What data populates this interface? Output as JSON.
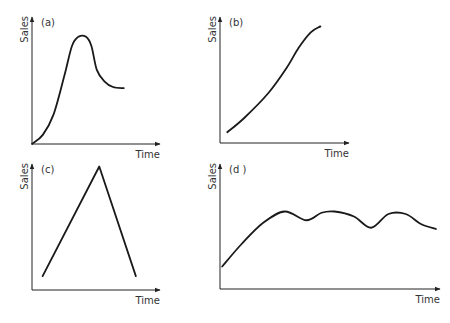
{
  "chart_data": [
    {
      "type": "line",
      "panel": "(a)",
      "title": "(a)",
      "xlabel": "Time",
      "ylabel": "Sales",
      "xlim": [
        0,
        10
      ],
      "ylim": [
        0,
        10
      ],
      "grid": false,
      "description": "S-shaped rise to a peak, then decline and levelling off",
      "x": [
        0,
        1,
        2,
        3,
        3.7,
        4.3,
        5,
        5.5,
        6,
        6.7,
        7.5,
        8.5
      ],
      "y": [
        0,
        0.8,
        2.6,
        6.0,
        8.6,
        9.4,
        9.4,
        8.6,
        6.5,
        5.5,
        5.0,
        4.9
      ]
    },
    {
      "type": "line",
      "panel": "(b)",
      "title": "(b)",
      "xlabel": "Time",
      "ylabel": "Sales",
      "xlim": [
        0,
        10
      ],
      "ylim": [
        0,
        10
      ],
      "grid": false,
      "description": "Steady, continuous growth that begins to flatten at the top",
      "x": [
        0.6,
        2,
        4,
        5.5,
        6.5,
        7.5,
        8.3
      ],
      "y": [
        0.9,
        2.1,
        4.2,
        6.3,
        8.0,
        9.3,
        9.8
      ]
    },
    {
      "type": "line",
      "panel": "(c)",
      "title": "(c)",
      "xlabel": "Time",
      "ylabel": "Sales",
      "xlim": [
        0,
        10
      ],
      "ylim": [
        0,
        10
      ],
      "grid": false,
      "description": "Linear rise to a sharp peak followed by a linear fall",
      "x": [
        0.9,
        5.7,
        8.8
      ],
      "y": [
        1.1,
        9.8,
        1.1
      ]
    },
    {
      "type": "line",
      "panel": "(d)",
      "title": "(d )",
      "xlabel": "Time",
      "ylabel": "Sales",
      "xlim": [
        0,
        10
      ],
      "ylim": [
        0,
        10
      ],
      "grid": false,
      "description": "Rapid initial growth then repeated fluctuations around a plateau",
      "x": [
        0.1,
        1,
        2,
        3,
        4,
        4.7,
        5.3,
        6.2,
        7,
        7.8,
        8.6,
        9.3,
        10
      ],
      "y": [
        1.8,
        3.6,
        5.3,
        6.2,
        5.5,
        6.1,
        6.2,
        5.8,
        4.9,
        6.0,
        6.0,
        5.2,
        4.8
      ]
    }
  ]
}
